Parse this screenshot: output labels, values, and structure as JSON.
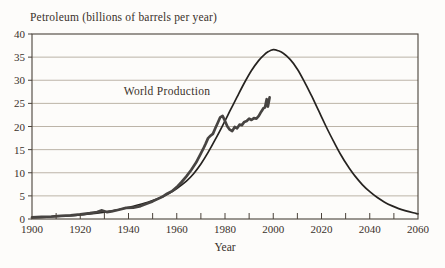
{
  "colors": {
    "paper": "#fdfcfa",
    "ink": "#3a312a",
    "frame": "#4a423a",
    "grid": "#b4ab9e",
    "curve": "#262320",
    "production": "#474442"
  },
  "chart_data": {
    "type": "line",
    "title": "Petroleum (billions of barrels per year)",
    "xlabel": "Year",
    "ylabel": "",
    "xlim": [
      1900,
      2060
    ],
    "ylim": [
      0,
      40
    ],
    "x_label_ticks": [
      1900,
      1920,
      1940,
      1960,
      1980,
      2000,
      2020,
      2040,
      2060
    ],
    "x_minor_tick_step": 10,
    "y_ticks": [
      0,
      5,
      10,
      15,
      20,
      25,
      30,
      35,
      40
    ],
    "grid": "horizontal",
    "legend_position": "none",
    "annotation": {
      "text": "World Production",
      "year": 1938,
      "value": 26.8
    },
    "series": [
      {
        "name": "Projected production curve (bell curve)",
        "smooth": true,
        "width": 1.7,
        "color_key": "curve",
        "points": [
          [
            1900,
            0.3
          ],
          [
            1906,
            0.42
          ],
          [
            1912,
            0.6
          ],
          [
            1918,
            0.8
          ],
          [
            1924,
            1.1
          ],
          [
            1930,
            1.5
          ],
          [
            1936,
            2.05
          ],
          [
            1942,
            2.75
          ],
          [
            1948,
            3.6
          ],
          [
            1952,
            4.35
          ],
          [
            1956,
            5.3
          ],
          [
            1960,
            6.6
          ],
          [
            1964,
            8.2
          ],
          [
            1967,
            9.8
          ],
          [
            1970,
            11.9
          ],
          [
            1973,
            14.4
          ],
          [
            1976,
            17.2
          ],
          [
            1979,
            20.2
          ],
          [
            1982,
            23.3
          ],
          [
            1985,
            26.4
          ],
          [
            1988,
            29.4
          ],
          [
            1991,
            32.1
          ],
          [
            1994,
            34.3
          ],
          [
            1996,
            35.4
          ],
          [
            1998,
            36.2
          ],
          [
            2000,
            36.6
          ],
          [
            2002,
            36.4
          ],
          [
            2004,
            35.9
          ],
          [
            2007,
            34.5
          ],
          [
            2010,
            32.4
          ],
          [
            2013,
            29.6
          ],
          [
            2016,
            26.5
          ],
          [
            2019,
            23.2
          ],
          [
            2022,
            19.9
          ],
          [
            2025,
            16.8
          ],
          [
            2028,
            13.9
          ],
          [
            2031,
            11.4
          ],
          [
            2034,
            9.2
          ],
          [
            2037,
            7.4
          ],
          [
            2040,
            5.9
          ],
          [
            2043,
            4.7
          ],
          [
            2046,
            3.7
          ],
          [
            2049,
            2.9
          ],
          [
            2052,
            2.25
          ],
          [
            2055,
            1.75
          ],
          [
            2058,
            1.35
          ],
          [
            2060,
            1.1
          ]
        ]
      },
      {
        "name": "World Production",
        "smooth": false,
        "width": 2.7,
        "color_key": "production",
        "points": [
          [
            1900,
            0.35
          ],
          [
            1904,
            0.45
          ],
          [
            1908,
            0.55
          ],
          [
            1912,
            0.7
          ],
          [
            1916,
            0.8
          ],
          [
            1920,
            1.0
          ],
          [
            1924,
            1.25
          ],
          [
            1927,
            1.5
          ],
          [
            1929,
            1.85
          ],
          [
            1931,
            1.5
          ],
          [
            1933,
            1.65
          ],
          [
            1936,
            2.0
          ],
          [
            1939,
            2.4
          ],
          [
            1942,
            2.45
          ],
          [
            1945,
            2.8
          ],
          [
            1948,
            3.4
          ],
          [
            1950,
            3.8
          ],
          [
            1952,
            4.3
          ],
          [
            1954,
            4.8
          ],
          [
            1956,
            5.5
          ],
          [
            1958,
            6.0
          ],
          [
            1960,
            6.9
          ],
          [
            1962,
            8.0
          ],
          [
            1964,
            9.2
          ],
          [
            1966,
            10.6
          ],
          [
            1968,
            12.2
          ],
          [
            1970,
            14.2
          ],
          [
            1971,
            15.2
          ],
          [
            1972,
            16.3
          ],
          [
            1973,
            17.5
          ],
          [
            1974,
            18.0
          ],
          [
            1975,
            18.4
          ],
          [
            1976,
            19.6
          ],
          [
            1977,
            20.8
          ],
          [
            1978,
            22.0
          ],
          [
            1979,
            22.3
          ],
          [
            1980,
            21.2
          ],
          [
            1981,
            20.0
          ],
          [
            1982,
            19.3
          ],
          [
            1983,
            19.0
          ],
          [
            1984,
            19.9
          ],
          [
            1985,
            19.6
          ],
          [
            1986,
            20.4
          ],
          [
            1987,
            20.3
          ],
          [
            1988,
            21.0
          ],
          [
            1989,
            21.2
          ],
          [
            1990,
            21.7
          ],
          [
            1991,
            21.4
          ],
          [
            1992,
            21.8
          ],
          [
            1993,
            21.7
          ],
          [
            1994,
            22.3
          ],
          [
            1995,
            23.2
          ],
          [
            1996,
            24.0
          ],
          [
            1996.6,
            24.1
          ],
          [
            1997.3,
            25.9
          ],
          [
            1997.8,
            24.3
          ],
          [
            1998.5,
            26.3
          ]
        ]
      }
    ]
  }
}
